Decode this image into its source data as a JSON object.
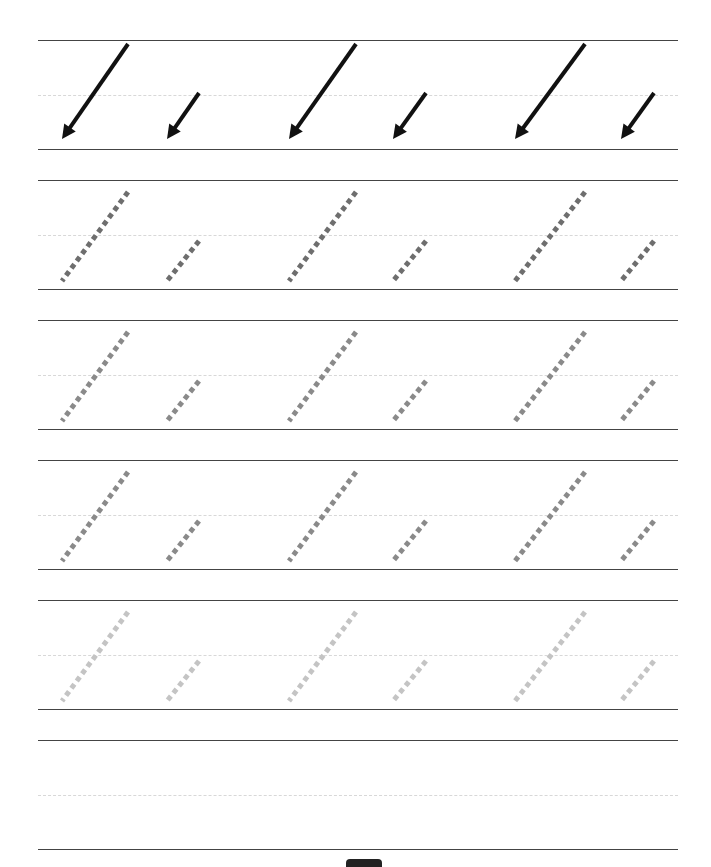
{
  "worksheet": {
    "title": "",
    "rows": [
      {
        "kind": "arrows",
        "top": 40,
        "bottom": 149,
        "color": "#111111"
      },
      {
        "kind": "dotted",
        "top": 180,
        "bottom": 289,
        "color": "#6e6e6e"
      },
      {
        "kind": "dotted",
        "top": 320,
        "bottom": 429,
        "color": "#8a8a8a"
      },
      {
        "kind": "dotted",
        "top": 460,
        "bottom": 569,
        "color": "#8a8a8a"
      },
      {
        "kind": "dotted",
        "top": 600,
        "bottom": 709,
        "color": "#c4c4c4"
      },
      {
        "kind": "blank",
        "top": 740,
        "bottom": 849,
        "color": ""
      }
    ],
    "strokes_per_row": [
      {
        "type": "long",
        "x_start": 128,
        "x_end": 62
      },
      {
        "type": "short",
        "x_start": 199,
        "x_end": 167
      },
      {
        "type": "long",
        "x_start": 356,
        "x_end": 289
      },
      {
        "type": "short",
        "x_start": 426,
        "x_end": 393
      },
      {
        "type": "long",
        "x_start": 585,
        "x_end": 515
      },
      {
        "type": "short",
        "x_start": 654,
        "x_end": 621
      }
    ],
    "page_marker": "page-tab"
  }
}
